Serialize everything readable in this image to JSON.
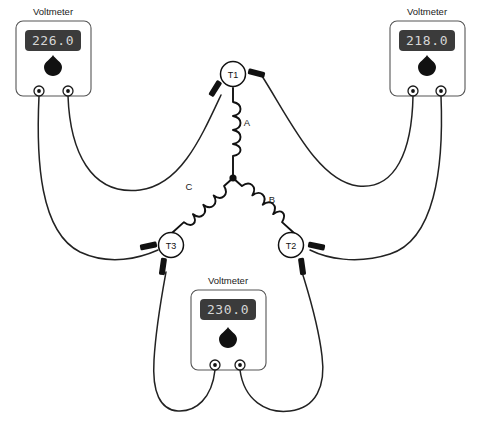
{
  "diagram": {
    "meter_label": "Voltmeter",
    "colors": {
      "wire": "#222222",
      "lcd_background": "#3b3b3b",
      "lcd_digits": "#d6d6d6",
      "coil": "#111111",
      "meter_outline": "#555555",
      "background": "#ffffff"
    }
  },
  "meters": [
    {
      "id": "meter-left",
      "label": "Voltmeter",
      "reading": "226.0",
      "position": "top-left",
      "jacks": [
        "left-jack",
        "right-jack"
      ],
      "measures": "T3 to T1"
    },
    {
      "id": "meter-right",
      "label": "Voltmeter",
      "reading": "218.0",
      "position": "top-right",
      "jacks": [
        "left-jack",
        "right-jack"
      ],
      "measures": "T1 to T2"
    },
    {
      "id": "meter-bottom",
      "label": "Voltmeter",
      "reading": "230.0",
      "position": "bottom-center",
      "jacks": [
        "left-jack",
        "right-jack"
      ],
      "measures": "T3 to T2"
    }
  ],
  "terminals": [
    {
      "id": "T1",
      "label": "T1"
    },
    {
      "id": "T2",
      "label": "T2"
    },
    {
      "id": "T3",
      "label": "T3"
    }
  ],
  "coils": [
    {
      "id": "A",
      "label": "A",
      "from": "T1",
      "to": "neutral"
    },
    {
      "id": "B",
      "label": "B",
      "from": "neutral",
      "to": "T2"
    },
    {
      "id": "C",
      "label": "C",
      "from": "neutral",
      "to": "T3"
    }
  ],
  "icons": {
    "knob": "knob-icon",
    "jack": "jack-icon",
    "clip": "clip-icon",
    "node": "junction-node-icon"
  }
}
